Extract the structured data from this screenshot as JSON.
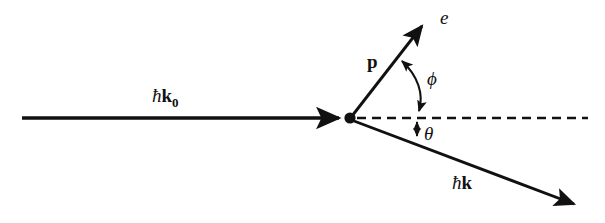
{
  "figure": {
    "name": "compton-scattering-diagram",
    "background_color": "#ffffff",
    "stroke_color": "#111111"
  },
  "labels": {
    "incident_photon": {
      "hbar": "ħ",
      "vector": "k",
      "subscript": "0",
      "full": "ħk₀"
    },
    "scattered_photon": {
      "hbar": "ħ",
      "vector": "k",
      "subscript": "",
      "full": "ħk"
    },
    "electron_particle": "e",
    "electron_momentum": "p",
    "angle_phi": "ϕ",
    "angle_theta": "θ"
  },
  "geometry": {
    "vertex": {
      "x": 350,
      "y": 118
    },
    "incident_ray": {
      "x1": 22,
      "y1": 118,
      "x2": 343,
      "y2": 118
    },
    "axis_dashed": {
      "x1": 356,
      "y1": 118,
      "x2": 588,
      "y2": 118
    },
    "electron_ray": {
      "x1": 352,
      "y1": 116,
      "x2": 425,
      "y2": 22
    },
    "scattered_ray": {
      "x1": 354,
      "y1": 121,
      "x2": 580,
      "y2": 207
    },
    "phi_arc": {
      "from_x": 400,
      "from_y": 58,
      "to_x": 419,
      "to_y": 115
    },
    "theta_arc": {
      "from_x": 417,
      "from_y": 119,
      "to_x": 417,
      "to_y": 139
    }
  }
}
